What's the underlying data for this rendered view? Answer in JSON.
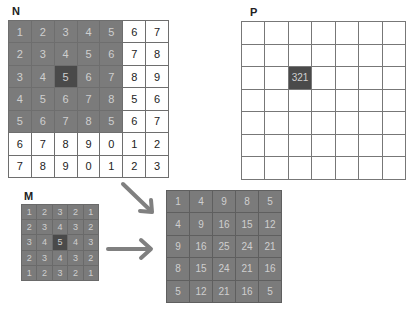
{
  "labels": {
    "n": "N",
    "p": "P",
    "m": "M"
  },
  "colors": {
    "shaded": "#7b7b7b",
    "highlight": "#4a4a4a",
    "white": "#ffffff",
    "border": "#6e6e6e",
    "arrow": "#808080"
  },
  "grid_n": {
    "values": [
      [
        "1",
        "2",
        "3",
        "4",
        "5",
        "6",
        "7"
      ],
      [
        "2",
        "3",
        "4",
        "5",
        "6",
        "7",
        "8"
      ],
      [
        "3",
        "4",
        "5",
        "6",
        "7",
        "8",
        "9"
      ],
      [
        "4",
        "5",
        "6",
        "7",
        "8",
        "5",
        "6"
      ],
      [
        "5",
        "6",
        "7",
        "8",
        "5",
        "6",
        "7"
      ],
      [
        "6",
        "7",
        "8",
        "9",
        "0",
        "1",
        "2"
      ],
      [
        "7",
        "8",
        "9",
        "0",
        "1",
        "2",
        "3"
      ]
    ],
    "shaded_region": {
      "rows": [
        0,
        4
      ],
      "cols": [
        0,
        4
      ]
    },
    "highlight": {
      "row": 2,
      "col": 2
    }
  },
  "grid_p": {
    "rows": 7,
    "cols": 7,
    "highlight": {
      "row": 2,
      "col": 2,
      "value": "321"
    }
  },
  "grid_m": {
    "values": [
      [
        "1",
        "2",
        "3",
        "2",
        "1"
      ],
      [
        "2",
        "3",
        "4",
        "3",
        "2"
      ],
      [
        "3",
        "4",
        "5",
        "4",
        "3"
      ],
      [
        "2",
        "3",
        "4",
        "3",
        "2"
      ],
      [
        "1",
        "2",
        "3",
        "2",
        "1"
      ]
    ],
    "highlight": {
      "row": 2,
      "col": 2
    }
  },
  "grid_result": {
    "values": [
      [
        "1",
        "4",
        "9",
        "8",
        "5"
      ],
      [
        "4",
        "9",
        "16",
        "15",
        "12"
      ],
      [
        "9",
        "16",
        "25",
        "24",
        "21"
      ],
      [
        "8",
        "15",
        "24",
        "21",
        "16"
      ],
      [
        "5",
        "12",
        "21",
        "16",
        "5"
      ]
    ]
  },
  "arrows": [
    {
      "name": "from-n",
      "from": [
        123,
        184
      ],
      "to": [
        152,
        212
      ]
    },
    {
      "name": "from-m",
      "from": [
        108,
        249
      ],
      "to": [
        152,
        249
      ]
    }
  ]
}
